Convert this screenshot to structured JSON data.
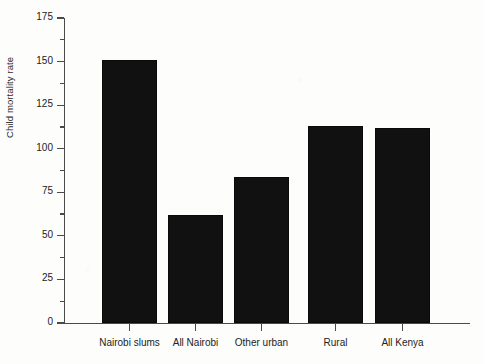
{
  "chart_data": {
    "type": "bar",
    "title": "",
    "subtitle": "",
    "xlabel": "",
    "ylabel": "Child mortality rate",
    "categories": [
      "Nairobi slums",
      "All Nairobi",
      "Other urban",
      "Rural",
      "All Kenya"
    ],
    "values": [
      151,
      62,
      84,
      113,
      112
    ],
    "ylim": [
      0,
      175
    ],
    "ytick_labels": [
      "0",
      "25",
      "50",
      "75",
      "100",
      "125",
      "150",
      "175"
    ],
    "ytick_values": [
      0,
      25,
      50,
      75,
      100,
      125,
      150,
      175
    ],
    "yminor_tick_values": [
      12.5,
      37.5,
      62.5,
      87.5,
      112.5,
      137.5,
      162.5
    ],
    "grid": false,
    "legend": null,
    "series": [
      {
        "name": "Child mortality rate",
        "color": "#111111",
        "values": [
          151,
          62,
          84,
          113,
          112
        ]
      }
    ],
    "colors": {
      "bar": "#111111",
      "axis": "#4a4a4a",
      "text": "#232323",
      "background": "#fdfdfc"
    }
  }
}
